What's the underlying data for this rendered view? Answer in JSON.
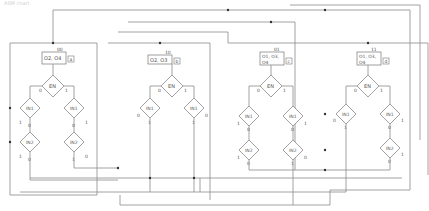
{
  "caption": "ASM chart",
  "colors": {
    "line": "#8a8a8a",
    "text": "#555555",
    "box": "#777777",
    "dot": "#333333"
  },
  "states": [
    {
      "name": "a",
      "code": "00",
      "outputs_line1": "O2, O4",
      "outputs_line2": "",
      "x": 42
    },
    {
      "name": "b",
      "code": "10",
      "outputs_line1": "O2, O3",
      "outputs_line2": "",
      "x": 160
    },
    {
      "name": "c",
      "code": "01",
      "outputs_line1": "O1, O3,",
      "outputs_line2": "O4",
      "x": 260
    },
    {
      "name": "d",
      "code": "11",
      "outputs_line1": "O1, O3,",
      "outputs_line2": "O4",
      "x": 357
    }
  ],
  "decisions": {
    "en": "EN",
    "in1": "IN1",
    "in2": "IN2"
  },
  "branch_labels": {
    "zero": "0",
    "one": "1"
  }
}
